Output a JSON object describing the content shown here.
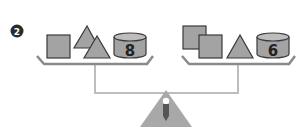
{
  "problem": {
    "number": "2"
  },
  "scale": {
    "left_pan": {
      "items": [
        "square",
        "triangle",
        "triangle",
        "cylinder"
      ],
      "cylinder_label": "8"
    },
    "right_pan": {
      "items": [
        "square",
        "square",
        "triangle",
        "cylinder"
      ],
      "cylinder_label": "6"
    },
    "state": "balanced"
  },
  "colors": {
    "shape_fill": "#a3a3a3",
    "shape_stroke": "#3a3a3a",
    "pan_stroke": "#8a8a8a",
    "beam": "#bdbdbd",
    "badge": "#2b2b2b"
  }
}
